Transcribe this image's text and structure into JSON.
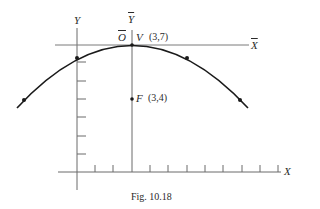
{
  "figure": {
    "caption": "Fig. 10.18",
    "axes": {
      "x_label": "X",
      "y_label": "Y",
      "xbar_label": "X",
      "ybar_label": "Y",
      "origin_bar_label": "O"
    },
    "points": {
      "vertex": {
        "label": "V",
        "coords": "(3,7)"
      },
      "focus": {
        "label": "F",
        "coords": "(3,4)"
      }
    },
    "parabola": {
      "equation": "(x-3)^2 = -12(y-7)",
      "vertex": [
        3,
        7
      ],
      "focus": [
        3,
        4
      ],
      "marked_points": [
        [
          -3,
          4
        ],
        [
          0,
          6.25
        ],
        [
          6,
          6.25
        ],
        [
          9,
          4
        ]
      ]
    },
    "ticks": {
      "x": [
        1,
        2,
        3,
        4,
        5,
        6,
        7,
        8,
        9,
        10,
        11
      ],
      "y": [
        1,
        2,
        3,
        4,
        5,
        6
      ]
    },
    "colors": {
      "curve": "#1a1a1a",
      "axis": "#6a6a6a",
      "text": "#2a2a2a"
    }
  }
}
